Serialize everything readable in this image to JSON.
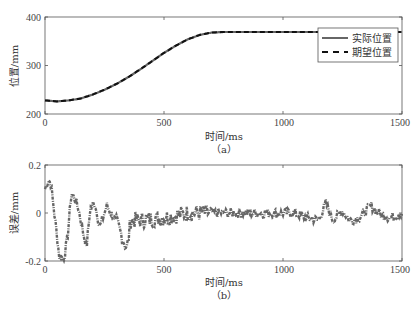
{
  "chart_data": [
    {
      "type": "line",
      "panel": "(a)",
      "title": "",
      "xlabel": "时间/ms",
      "ylabel": "位置/mm",
      "xlim": [
        0,
        1500
      ],
      "ylim": [
        200,
        400
      ],
      "xticks": [
        0,
        500,
        1000,
        1500
      ],
      "yticks": [
        200,
        300,
        400
      ],
      "grid": false,
      "legend_position": "upper right",
      "series": [
        {
          "name": "实际位置",
          "style": "solid",
          "color": "#666666",
          "x": [
            0,
            50,
            100,
            150,
            200,
            250,
            300,
            350,
            400,
            450,
            500,
            550,
            600,
            650,
            700,
            750,
            800,
            900,
            1000,
            1100,
            1200,
            1300,
            1400,
            1500
          ],
          "y": [
            228,
            226,
            228,
            232,
            240,
            250,
            262,
            276,
            292,
            309,
            326,
            341,
            354,
            363,
            368,
            369,
            369,
            369,
            369,
            369,
            369,
            369,
            369,
            369
          ]
        },
        {
          "name": "期望位置",
          "style": "dashed",
          "color": "#111111",
          "x": [
            0,
            50,
            100,
            150,
            200,
            250,
            300,
            350,
            400,
            450,
            500,
            550,
            600,
            650,
            700,
            750,
            800,
            900,
            1000,
            1100,
            1200,
            1300,
            1400,
            1500
          ],
          "y": [
            228,
            226,
            228,
            232,
            240,
            250,
            262,
            276,
            292,
            309,
            326,
            341,
            354,
            363,
            368,
            369,
            369,
            369,
            369,
            369,
            369,
            369,
            369,
            369
          ]
        }
      ]
    },
    {
      "type": "line",
      "panel": "(b)",
      "title": "",
      "xlabel": "时间/ms",
      "ylabel": "误差/mm",
      "xlim": [
        0,
        1500
      ],
      "ylim": [
        -0.2,
        0.2
      ],
      "xticks": [
        0,
        500,
        1000,
        1500
      ],
      "yticks": [
        -0.2,
        0,
        0.2
      ],
      "grid": false,
      "series": [
        {
          "name": "误差",
          "style": "dash-dot",
          "color": "#666666",
          "x": [
            0,
            15,
            25,
            45,
            60,
            80,
            95,
            110,
            125,
            140,
            160,
            175,
            190,
            210,
            230,
            260,
            300,
            345,
            360,
            400,
            500,
            600,
            700,
            800,
            900,
            1000,
            1050,
            1100,
            1150,
            1180,
            1210,
            1250,
            1280,
            1320,
            1370,
            1400,
            1450,
            1500
          ],
          "y": [
            0.1,
            0.14,
            0.12,
            -0.05,
            -0.18,
            -0.19,
            -0.1,
            0.08,
            0.06,
            0.02,
            -0.08,
            -0.14,
            0.02,
            0.04,
            -0.06,
            0.03,
            -0.04,
            -0.15,
            -0.03,
            -0.03,
            -0.02,
            0.0,
            0.0,
            0.0,
            0.0,
            0.0,
            0.0,
            -0.02,
            -0.03,
            0.04,
            -0.03,
            0.01,
            -0.03,
            -0.02,
            0.03,
            0.0,
            -0.02,
            0.0
          ],
          "noise_amplitude": [
            0.06,
            0.05,
            0.04,
            0.03,
            0.02,
            0.015
          ]
        }
      ]
    }
  ],
  "panels": {
    "a": {
      "ylabel": "位置/mm",
      "xlabel": "时间/ms",
      "caption": "（a）",
      "xtick_labels": [
        "0",
        "500",
        "1000",
        "1500"
      ],
      "ytick_labels": [
        "200",
        "300",
        "400"
      ],
      "legend": [
        {
          "label": "实际位置",
          "style": "solid"
        },
        {
          "label": "期望位置",
          "style": "dashed"
        }
      ]
    },
    "b": {
      "ylabel": "误差/mm",
      "xlabel": "时间/ms",
      "caption": "（b）",
      "xtick_labels": [
        "0",
        "500",
        "1000",
        "1500"
      ],
      "ytick_labels": [
        "-0.2",
        "0",
        "0.2"
      ]
    }
  },
  "colors": {
    "axis": "#555555",
    "actual": "#666666",
    "desired": "#111111",
    "error": "#666666"
  }
}
